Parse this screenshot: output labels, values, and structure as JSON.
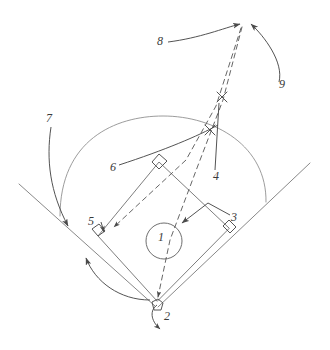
{
  "diagram": {
    "style": "hand-drawn pencil sketch",
    "stroke_color": "#4a4a4a",
    "label_color": "#3a3a3a",
    "background_color": "#ffffff",
    "field_elements": [
      {
        "name": "home-plate",
        "shape": "pentagon"
      },
      {
        "name": "first-base",
        "shape": "diamond"
      },
      {
        "name": "second-base",
        "shape": "diamond"
      },
      {
        "name": "third-base",
        "shape": "diamond"
      },
      {
        "name": "pitchers-mound",
        "shape": "circle"
      },
      {
        "name": "outfield-arc",
        "shape": "arc"
      },
      {
        "name": "foul-line-left",
        "shape": "line"
      },
      {
        "name": "foul-line-right",
        "shape": "line"
      },
      {
        "name": "infield-diamond",
        "shape": "quadrilateral"
      }
    ],
    "markers": [
      {
        "name": "x-mark-upper",
        "shape": "x"
      },
      {
        "name": "x-mark-lower",
        "shape": "x"
      }
    ],
    "callouts": [
      {
        "id": "1",
        "label": "1",
        "x": 161,
        "y": 237,
        "target": "pitchers-mound",
        "pointer": "circled"
      },
      {
        "id": "2",
        "label": "2",
        "x": 167,
        "y": 317,
        "target": "home-plate",
        "pointer": "curved-arrow"
      },
      {
        "id": "3",
        "label": "3",
        "x": 234,
        "y": 218,
        "target": "infield-right",
        "pointer": "elbow-arrow"
      },
      {
        "id": "4",
        "label": "4",
        "x": 216,
        "y": 176,
        "target": "x-mark-upper",
        "pointer": "straight-line"
      },
      {
        "id": "5",
        "label": "5",
        "x": 92,
        "y": 222,
        "target": "third-base",
        "pointer": "short-arrow"
      },
      {
        "id": "6",
        "label": "6",
        "x": 113,
        "y": 168,
        "target": "x-mark-lower",
        "pointer": "straight-line"
      },
      {
        "id": "7",
        "label": "7",
        "x": 49,
        "y": 119,
        "target": "foul-line-left",
        "pointer": "long-curved-arrow"
      },
      {
        "id": "8",
        "label": "8",
        "x": 160,
        "y": 42,
        "target": "apex-point",
        "pointer": "curved-arrow"
      },
      {
        "id": "9",
        "label": "9",
        "x": 282,
        "y": 85,
        "target": "apex-point",
        "pointer": "curved-arrow"
      }
    ],
    "dashed_paths": [
      {
        "name": "dashed-path-apex-to-third",
        "from": "apex-point",
        "to": "third-base"
      },
      {
        "name": "dashed-path-apex-to-home",
        "from": "apex-point",
        "to": "home-plate"
      }
    ]
  }
}
